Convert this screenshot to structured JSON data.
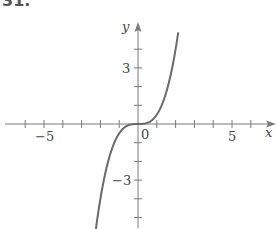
{
  "problem_number_partial": "31.",
  "chart_data": {
    "type": "line",
    "title": "",
    "xlabel": "x",
    "ylabel": "y",
    "xlim": [
      -7,
      7
    ],
    "ylim": [
      -5.5,
      5.5
    ],
    "x_tick_step": 1,
    "y_tick_step": 1,
    "x_tick_labels": [
      {
        "value": -5,
        "label": "−5"
      },
      {
        "value": 0,
        "label": "0"
      },
      {
        "value": 5,
        "label": "5"
      }
    ],
    "y_tick_labels": [
      {
        "value": 3,
        "label": "3"
      },
      {
        "value": -3,
        "label": "−3"
      }
    ],
    "grid": false,
    "legend": null,
    "series": [
      {
        "name": "curve",
        "description": "cubic-like curve through origin, approx y = x^3/2",
        "x": [
          -2.26,
          -2.0,
          -1.5,
          -1.0,
          -0.5,
          0,
          0.5,
          1.0,
          1.5,
          2.0,
          2.15
        ],
        "y": [
          -5.45,
          -4.0,
          -1.69,
          -0.5,
          -0.06,
          0,
          0.06,
          0.5,
          1.69,
          4.0,
          5.0
        ]
      }
    ],
    "colors": {
      "axis": "#7a7a7a",
      "curve": "#6a6a6a",
      "text": "#444444"
    }
  }
}
